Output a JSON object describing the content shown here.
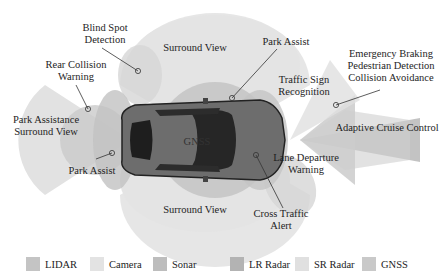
{
  "diagram": {
    "center_label": "GNSS",
    "annotations": [
      {
        "id": "blind-spot",
        "lines": [
          "Blind Spot",
          "Detection"
        ]
      },
      {
        "id": "surround-top",
        "lines": [
          "Surround View"
        ]
      },
      {
        "id": "park-assist-front",
        "lines": [
          "Park Assist"
        ]
      },
      {
        "id": "emergency",
        "lines": [
          "Emergency Braking",
          "Pedestrian Detection",
          "Collision Avoidance"
        ]
      },
      {
        "id": "rear-collision",
        "lines": [
          "Rear Collision",
          "Warning"
        ]
      },
      {
        "id": "traffic-sign",
        "lines": [
          "Traffic Sign",
          "Recognition"
        ]
      },
      {
        "id": "park-assistance-rear",
        "lines": [
          "Park Assistance",
          "Surround View"
        ]
      },
      {
        "id": "acc",
        "lines": [
          "Adaptive Cruise Control"
        ]
      },
      {
        "id": "park-assist-rear",
        "lines": [
          "Park Assist"
        ]
      },
      {
        "id": "lane-departure",
        "lines": [
          "Lane Departure",
          "Warning"
        ]
      },
      {
        "id": "surround-bottom",
        "lines": [
          "Surround View"
        ]
      },
      {
        "id": "cross-traffic",
        "lines": [
          "Cross Traffic",
          "Alert"
        ]
      }
    ]
  },
  "legend": [
    {
      "label": "LIDAR",
      "color": "#c4c4c4"
    },
    {
      "label": "Camera",
      "color": "#e3e3e3"
    },
    {
      "label": "Sonar",
      "color": "#bdbdbd"
    },
    {
      "label": "LR Radar",
      "color": "#b3b3b3"
    },
    {
      "label": "SR Radar",
      "color": "#e0e0e0"
    },
    {
      "label": "GNSS",
      "color": "#c9c9c9"
    }
  ]
}
